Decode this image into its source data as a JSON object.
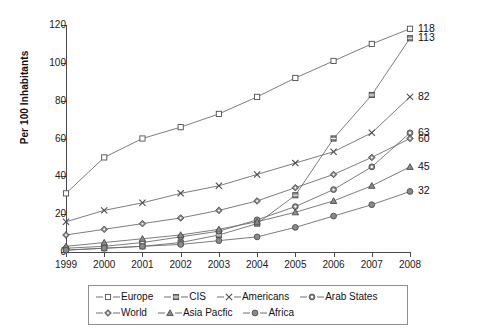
{
  "chart_data": {
    "type": "line",
    "title": "",
    "xlabel": "",
    "ylabel": "Per 100 Inhabitants",
    "categories": [
      "1999",
      "2000",
      "2001",
      "2002",
      "2003",
      "2004",
      "2005",
      "2006",
      "2007",
      "2008"
    ],
    "x": [
      1999,
      2000,
      2001,
      2002,
      2003,
      2004,
      2005,
      2006,
      2007,
      2008
    ],
    "xlim": [
      1999,
      2008
    ],
    "ylim": [
      0,
      120
    ],
    "yticks": [
      0,
      20,
      40,
      60,
      80,
      100,
      120
    ],
    "grid": false,
    "legend_position": "bottom",
    "series": [
      {
        "name": "Europe",
        "marker": "open-square",
        "end_label": "118",
        "values": [
          31,
          50,
          60,
          66,
          73,
          82,
          92,
          101,
          110,
          118
        ]
      },
      {
        "name": "CIS",
        "marker": "filled-square",
        "end_label": "113",
        "values": [
          1,
          2,
          3,
          5,
          9,
          15,
          30,
          60,
          83,
          113
        ]
      },
      {
        "name": "Americans",
        "marker": "cross",
        "end_label": "82",
        "values": [
          16,
          22,
          26,
          31,
          35,
          41,
          47,
          53,
          63,
          82
        ]
      },
      {
        "name": "Arab States",
        "marker": "open-circle",
        "end_label": "63",
        "values": [
          2,
          3,
          5,
          8,
          11,
          17,
          24,
          33,
          45,
          63
        ]
      },
      {
        "name": "World",
        "marker": "diamond",
        "end_label": "60",
        "values": [
          9,
          12,
          15,
          18,
          22,
          27,
          34,
          41,
          50,
          60
        ]
      },
      {
        "name": "Asia Pacfic",
        "marker": "triangle",
        "end_label": "45",
        "values": [
          3,
          5,
          7,
          9,
          12,
          16,
          21,
          27,
          35,
          45
        ]
      },
      {
        "name": "Africa",
        "marker": "filled-circle",
        "end_label": "32",
        "values": [
          1,
          2,
          3,
          4,
          6,
          8,
          13,
          19,
          25,
          32
        ]
      }
    ],
    "end_labels": [
      "118",
      "113",
      "82",
      "63",
      "60",
      "45",
      "32"
    ],
    "colors": {
      "line": "#6e6e6e",
      "marker_stroke": "#4d4d4d",
      "marker_fill": "#8a8a8a",
      "axis": "#4a4a4a",
      "text": "#111111"
    }
  },
  "legend": {
    "rows": [
      [
        {
          "label": "Europe",
          "marker": "open-square"
        },
        {
          "label": "CIS",
          "marker": "filled-square"
        },
        {
          "label": "Americans",
          "marker": "cross"
        },
        {
          "label": "Arab States",
          "marker": "open-circle"
        }
      ],
      [
        {
          "label": "World",
          "marker": "diamond"
        },
        {
          "label": "Asia Pacfic",
          "marker": "triangle"
        },
        {
          "label": "Africa",
          "marker": "filled-circle"
        }
      ]
    ]
  }
}
